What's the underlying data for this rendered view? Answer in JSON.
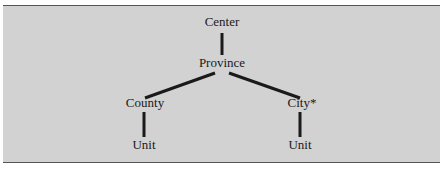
{
  "diagram": {
    "nodes": [
      {
        "id": "center",
        "label": "Center"
      },
      {
        "id": "province",
        "label": "Province"
      },
      {
        "id": "county",
        "label": "County"
      },
      {
        "id": "city",
        "label": "City*"
      },
      {
        "id": "unit_county",
        "label": "Unit"
      },
      {
        "id": "unit_city",
        "label": "Unit"
      }
    ],
    "edges": [
      {
        "from": "center",
        "to": "province"
      },
      {
        "from": "province",
        "to": "county"
      },
      {
        "from": "province",
        "to": "city"
      },
      {
        "from": "county",
        "to": "unit_county"
      },
      {
        "from": "city",
        "to": "unit_city"
      }
    ],
    "colors": {
      "background": "#d2d2d2",
      "line": "#1a1a1a",
      "rule": "#555555"
    }
  }
}
